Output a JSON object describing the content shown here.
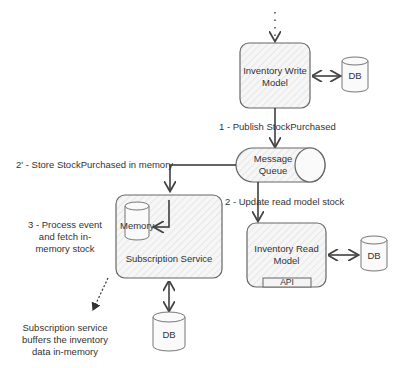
{
  "nodes": {
    "write_model": {
      "label_line1": "Inventory Write",
      "label_line2": "Model"
    },
    "write_db": {
      "label": "DB"
    },
    "queue": {
      "label_line1": "Message",
      "label_line2": "Queue"
    },
    "read_model": {
      "label_line1": "Inventory Read",
      "label_line2": "Model",
      "api_label": "API"
    },
    "read_db": {
      "label": "DB"
    },
    "subscription_service": {
      "label": "Subscription Service",
      "memory_label": "Memory"
    },
    "subscription_db": {
      "label": "DB"
    }
  },
  "edges": {
    "publish": "1 - Publish StockPurchased",
    "update_read": "2 - Update read model stock",
    "store_memory": "2' - Store StockPurchased in memory"
  },
  "annotations": {
    "process_line1": "3 - Process event",
    "process_line2": "and fetch in-",
    "process_line3": "memory stock",
    "buffer_line1": "Subscription service",
    "buffer_line2": "buffers the inventory",
    "buffer_line3": "data in-memory"
  },
  "colors": {
    "stroke": "#555555",
    "fill": "#f4f4f4",
    "hatch": "#dcdcdc"
  }
}
